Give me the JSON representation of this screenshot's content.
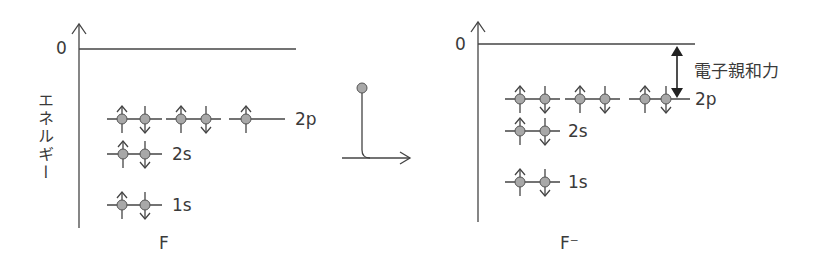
{
  "diagram": {
    "left_panel": {
      "axis_label": "エネルギー",
      "zero_label": "0",
      "species_label": "F",
      "levels": [
        {
          "name": "2p",
          "label": "2p",
          "orbitals": [
            "up-down",
            "up-down",
            "up"
          ]
        },
        {
          "name": "2s",
          "label": "2s",
          "orbitals": [
            "up-down"
          ]
        },
        {
          "name": "1s",
          "label": "1s",
          "orbitals": [
            "up-down"
          ]
        }
      ]
    },
    "transition": {
      "description": "incoming electron added",
      "icon": "electron-addition-arrow"
    },
    "right_panel": {
      "zero_label": "0",
      "species_label": "F⁻",
      "annotation": "電子親和力",
      "levels": [
        {
          "name": "2p",
          "label": "2p",
          "orbitals": [
            "up-down",
            "up-down",
            "up-down"
          ]
        },
        {
          "name": "2s",
          "label": "2s",
          "orbitals": [
            "up-down"
          ]
        },
        {
          "name": "1s",
          "label": "1s",
          "orbitals": [
            "up-down"
          ]
        }
      ]
    },
    "colors": {
      "line": "#444444",
      "electron_fill": "#a8a8a8",
      "background": "#ffffff"
    }
  }
}
